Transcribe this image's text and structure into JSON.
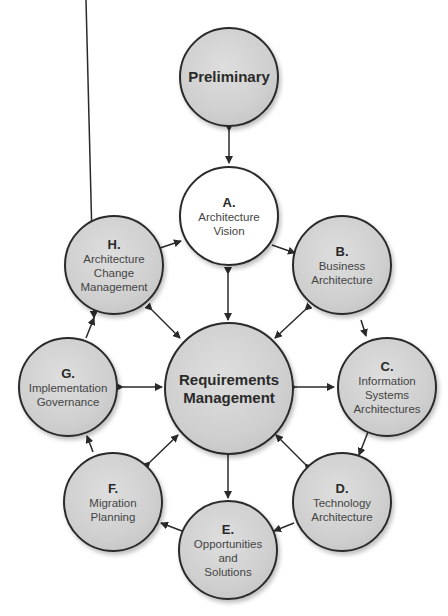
{
  "diagram": {
    "type": "TOGAF ADM cycle",
    "center": {
      "title_line1": "Requirements",
      "title_line2": "Management"
    },
    "preliminary": {
      "title": "Preliminary"
    },
    "phases": [
      {
        "id": "A",
        "letter": "A.",
        "lines": [
          "Architecture",
          "Vision"
        ]
      },
      {
        "id": "B",
        "letter": "B.",
        "lines": [
          "Business",
          "Architecture"
        ]
      },
      {
        "id": "C",
        "letter": "C.",
        "lines": [
          "Information",
          "Systems",
          "Architectures"
        ]
      },
      {
        "id": "D",
        "letter": "D.",
        "lines": [
          "Technology",
          "Architecture"
        ]
      },
      {
        "id": "E",
        "letter": "E.",
        "lines": [
          "Opportunities",
          "and",
          "Solutions"
        ]
      },
      {
        "id": "F",
        "letter": "F.",
        "lines": [
          "Migration",
          "Planning"
        ]
      },
      {
        "id": "G",
        "letter": "G.",
        "lines": [
          "Implementation",
          "Governance"
        ]
      },
      {
        "id": "H",
        "letter": "H.",
        "lines": [
          "Architecture",
          "Change",
          "Management"
        ]
      }
    ],
    "colors": {
      "node_fill": "#cfcfcf",
      "node_border": "#2a2a2a",
      "vision_fill": "#ffffff",
      "arrow": "#2a2a2a"
    }
  }
}
